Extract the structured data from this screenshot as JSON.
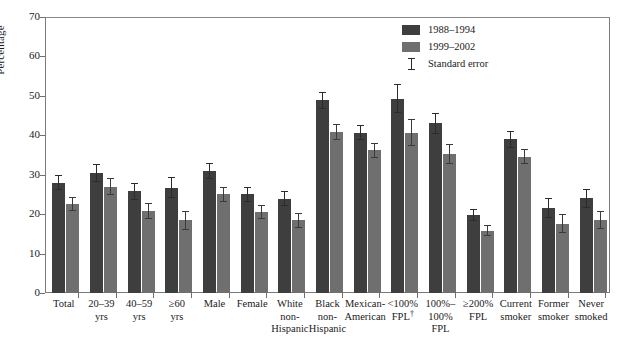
{
  "chart_data": {
    "type": "bar",
    "title": "",
    "xlabel": "",
    "ylabel": "Percentage",
    "ylim": [
      0,
      70
    ],
    "yticks": [
      0,
      10,
      20,
      30,
      40,
      50,
      60,
      70
    ],
    "grid": false,
    "legend_position": "top-right",
    "categories": [
      [
        "Total"
      ],
      [
        "20–39",
        "yrs"
      ],
      [
        "40–59",
        "yrs"
      ],
      [
        "≥60",
        "yrs"
      ],
      [
        "Male"
      ],
      [
        "Female"
      ],
      [
        "White",
        "non-",
        "Hispanic"
      ],
      [
        "Black",
        "non-",
        "Hispanic"
      ],
      [
        "Mexican-",
        "American"
      ],
      [
        "<100%",
        "FPL†"
      ],
      [
        "100%–",
        "100%",
        "FPL"
      ],
      [
        "≥200%",
        "FPL"
      ],
      [
        "Current",
        "smoker"
      ],
      [
        "Former",
        "smoker"
      ],
      [
        "Never",
        "smoked"
      ]
    ],
    "series": [
      {
        "name": "1988–1994",
        "color": "#3e3e3e",
        "values": [
          28.0,
          30.4,
          25.8,
          26.7,
          31.0,
          25.0,
          23.9,
          48.9,
          40.7,
          49.3,
          43.0,
          19.7,
          39.0,
          21.5,
          24.0
        ],
        "errors": [
          1.9,
          2.2,
          2.1,
          2.6,
          2.0,
          1.8,
          1.9,
          2.2,
          2.0,
          3.6,
          2.6,
          1.5,
          2.1,
          2.5,
          2.4
        ]
      },
      {
        "name": "1999–2002",
        "color": "#6f6f6f",
        "values": [
          22.5,
          27.0,
          20.8,
          18.4,
          25.1,
          20.5,
          18.4,
          40.8,
          36.2,
          40.6,
          35.2,
          15.8,
          34.6,
          17.6,
          18.4
        ]
      }
    ],
    "legend": [
      {
        "kind": "swatch",
        "style": "a",
        "label": "1988–1994"
      },
      {
        "kind": "swatch",
        "style": "b",
        "label": "1999–2002"
      },
      {
        "kind": "errorbar",
        "style": "e",
        "label": "Standard error"
      }
    ]
  }
}
